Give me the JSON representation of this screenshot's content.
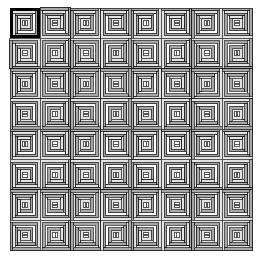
{
  "figure": {
    "kind": "quilt-pattern-diagram",
    "background_color": "#ffffff",
    "canvas": {
      "width": 265,
      "height": 268
    }
  },
  "grid": {
    "rows": 8,
    "cols": 8,
    "origin_x": 10,
    "origin_y": 8,
    "tile_size": 30.3,
    "total_blocks": 64
  },
  "block": {
    "name": "log-cabin-block",
    "rings": 5,
    "ring_width": 2.9,
    "center_size": 5,
    "outline_color": "#1a1a1a",
    "outline_width": 0.7,
    "light_color": "#ffffff",
    "mid_color": "#e2e2e2",
    "dark_color": "#a6a6a6",
    "center_color": "#ffffff",
    "center_bar_color": "#555555",
    "ring_palette": [
      "#e2e2e2",
      "#a6a6a6",
      "#ffffff",
      "#a6a6a6",
      "#e2e2e2"
    ]
  },
  "selection": {
    "label": "selected-block",
    "row": 0,
    "col": 0,
    "border_color": "#000000",
    "border_width": 3.2,
    "visible": true
  },
  "orientation_map": {
    "description": "per-block rotation in quarter turns, row-major 8x8",
    "values": [
      [
        0,
        1,
        0,
        1,
        0,
        1,
        0,
        1
      ],
      [
        3,
        2,
        3,
        2,
        3,
        2,
        3,
        2
      ],
      [
        0,
        1,
        0,
        1,
        0,
        1,
        0,
        1
      ],
      [
        3,
        2,
        3,
        2,
        3,
        2,
        3,
        2
      ],
      [
        0,
        1,
        0,
        1,
        0,
        1,
        0,
        1
      ],
      [
        3,
        2,
        3,
        2,
        3,
        2,
        3,
        2
      ],
      [
        0,
        1,
        0,
        1,
        0,
        1,
        0,
        1
      ],
      [
        3,
        2,
        3,
        2,
        3,
        2,
        3,
        2
      ]
    ]
  }
}
